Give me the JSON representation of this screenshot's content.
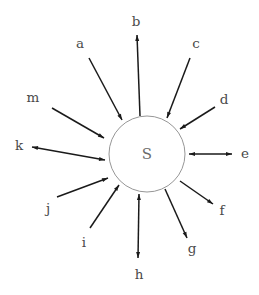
{
  "diagram": {
    "type": "radial-hub-and-spoke",
    "title": "",
    "canvas": {
      "width": 259,
      "height": 295,
      "background": "#ffffff"
    },
    "hub": {
      "label": "S",
      "center_x": 147,
      "center_y": 154,
      "radius": 38,
      "stroke_color": "#8a8a8a",
      "fill_color": "#ffffff",
      "label_color": "#6b6b6b"
    },
    "edge_style": {
      "line_color": "#1a1a1a",
      "line_width": 1.5,
      "arrowhead_length": 6,
      "arrowhead_width": 4
    },
    "label_color": "#4a4a4a",
    "spokes": [
      {
        "id": "spoke-a",
        "label": "a",
        "direction": "inward",
        "label_x": 80,
        "label_y": 44,
        "tail_x": 89,
        "tail_y": 58,
        "head_x": 122,
        "head_y": 120
      },
      {
        "id": "spoke-b",
        "label": "b",
        "direction": "outward",
        "label_x": 136,
        "label_y": 22,
        "tail_x": 140,
        "tail_y": 116,
        "head_x": 137,
        "head_y": 35
      },
      {
        "id": "spoke-c",
        "label": "c",
        "direction": "inward",
        "label_x": 196,
        "label_y": 44,
        "tail_x": 190,
        "tail_y": 58,
        "head_x": 167,
        "head_y": 118
      },
      {
        "id": "spoke-d",
        "label": "d",
        "direction": "inward",
        "label_x": 224,
        "label_y": 100,
        "tail_x": 215,
        "tail_y": 107,
        "head_x": 180,
        "head_y": 129
      },
      {
        "id": "spoke-e",
        "label": "e",
        "direction": "bidirectional",
        "label_x": 245,
        "label_y": 154,
        "tail_x": 189,
        "tail_y": 154,
        "head_x": 232,
        "head_y": 154
      },
      {
        "id": "spoke-f",
        "label": "f",
        "direction": "outward",
        "label_x": 222,
        "label_y": 211,
        "tail_x": 180,
        "tail_y": 181,
        "head_x": 213,
        "head_y": 204
      },
      {
        "id": "spoke-g",
        "label": "g",
        "direction": "outward",
        "label_x": 192,
        "label_y": 249,
        "tail_x": 165,
        "tail_y": 189,
        "head_x": 187,
        "head_y": 238
      },
      {
        "id": "spoke-h",
        "label": "h",
        "direction": "bidirectional",
        "label_x": 139,
        "label_y": 275,
        "tail_x": 139,
        "tail_y": 194,
        "head_x": 138,
        "head_y": 258
      },
      {
        "id": "spoke-i",
        "label": "i",
        "direction": "inward",
        "label_x": 84,
        "label_y": 243,
        "tail_x": 90,
        "tail_y": 228,
        "head_x": 119,
        "head_y": 185
      },
      {
        "id": "spoke-j",
        "label": "j",
        "direction": "inward",
        "label_x": 48,
        "label_y": 209,
        "tail_x": 57,
        "tail_y": 197,
        "head_x": 108,
        "head_y": 178
      },
      {
        "id": "spoke-k",
        "label": "k",
        "direction": "bidirectional",
        "label_x": 19,
        "label_y": 146,
        "tail_x": 105,
        "tail_y": 160,
        "head_x": 32,
        "head_y": 147
      },
      {
        "id": "spoke-m",
        "label": "m",
        "direction": "inward",
        "label_x": 33,
        "label_y": 98,
        "tail_x": 52,
        "tail_y": 108,
        "head_x": 104,
        "head_y": 138
      }
    ]
  }
}
